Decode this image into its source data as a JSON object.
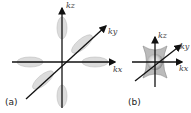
{
  "panel_a": {
    "label": "(a)",
    "axes": {
      "z": "kz",
      "y": "ky",
      "x": "kx"
    }
  },
  "panel_b": {
    "label": "(b)",
    "axes": {
      "z": "kz",
      "y": "ky",
      "x": "kx"
    }
  },
  "colors": {
    "axis": "#111111",
    "lobe": "#d8d8d8",
    "lobe_edge": "#bdbdbd",
    "sphere": "#f0f0f0"
  }
}
